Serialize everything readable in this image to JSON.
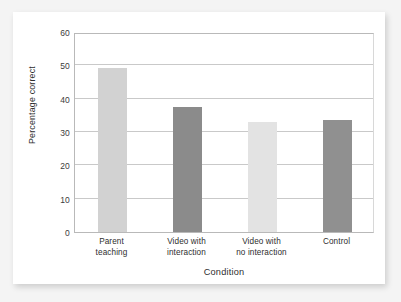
{
  "chart_data": {
    "type": "bar",
    "title": "",
    "subtitle": "",
    "xlabel": "Condition",
    "ylabel": "Percentage correct",
    "categories": [
      "Parent teaching",
      "Video with interaction",
      "Video with no interaction",
      "Control"
    ],
    "category_lines": [
      [
        "Parent",
        "teaching"
      ],
      [
        "Video with",
        "interaction"
      ],
      [
        "Video with",
        "no interaction"
      ],
      [
        "Control",
        ""
      ]
    ],
    "values": [
      49.3,
      37.4,
      33.0,
      33.6
    ],
    "bar_colors": [
      "#d2d2d2",
      "#8b8b8b",
      "#e3e3e3",
      "#909090"
    ],
    "ylim": [
      0,
      60
    ],
    "ytick_labels": [
      "0",
      "10",
      "20",
      "30",
      "40",
      "50",
      "60"
    ],
    "ytick_values": [
      0,
      10,
      20,
      30,
      40,
      50,
      60
    ],
    "grid": true,
    "grid_axis": "y",
    "legend": "none",
    "axis_color": "#b9b9b9",
    "grid_color": "#c9c9c9",
    "plot_background": "#ffffff",
    "page_background": "#f4f4f4"
  }
}
